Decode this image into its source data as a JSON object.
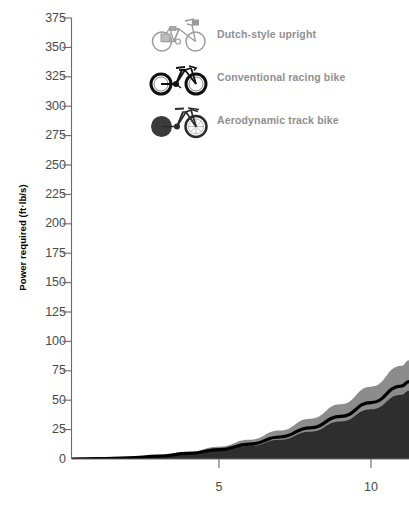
{
  "chart_data": {
    "type": "area",
    "title": "",
    "subtitle": "",
    "xlabel": "",
    "ylabel": "Power required (ft·lb/s)",
    "ylim": [
      0,
      375
    ],
    "xlim": [
      0,
      11.25
    ],
    "yticks": [
      0,
      25,
      50,
      75,
      100,
      125,
      150,
      175,
      200,
      225,
      250,
      275,
      300,
      325,
      350,
      375
    ],
    "ytick_labels": [
      "0",
      "25",
      "50",
      "75",
      "100",
      "125",
      "150",
      "175",
      "200",
      "225",
      "250",
      "275",
      "300",
      "325",
      "350",
      "375"
    ],
    "xticks": [
      5,
      10
    ],
    "xtick_labels": [
      "5",
      "10"
    ],
    "grid": false,
    "legend_position": "top-center",
    "x": [
      0,
      1,
      2,
      3,
      4,
      5,
      6,
      7,
      8,
      9,
      10,
      11,
      11.25
    ],
    "series": [
      {
        "name": "Dutch-style upright",
        "color": "#8c8c8c",
        "values": [
          0,
          0.4,
          1.4,
          3.2,
          6.2,
          10.5,
          16.4,
          24.3,
          34.3,
          46.6,
          61.5,
          79.2,
          84.0
        ]
      },
      {
        "name": "Conventional racing bike",
        "color": "#000000",
        "values": [
          0,
          0.3,
          1.0,
          2.4,
          4.7,
          8.0,
          12.6,
          18.7,
          26.5,
          36.2,
          48.0,
          62.0,
          65.8
        ]
      },
      {
        "name": "Aerodynamic track bike",
        "color": "#2e2e2e",
        "values": [
          0,
          0.25,
          0.9,
          2.1,
          4.1,
          7.0,
          11.0,
          16.4,
          23.2,
          31.8,
          42.2,
          54.6,
          58.0
        ]
      }
    ]
  },
  "axes": {
    "y_axis_title": "Power required (ft·lb/s)"
  },
  "legend": {
    "items": [
      {
        "icon": "dutch-upright-bicycle-icon",
        "label": "Dutch-style upright",
        "color": "#8c8c8c"
      },
      {
        "icon": "racing-bicycle-icon",
        "label": "Conventional racing bike",
        "color": "#000000"
      },
      {
        "icon": "aero-track-bicycle-icon",
        "label": "Aerodynamic track bike",
        "color": "#2e2e2e"
      }
    ]
  },
  "colors": {
    "dutch": "#8c8c8c",
    "racing": "#000000",
    "aero": "#2e2e2e",
    "axis": "#6b6b6b",
    "tick_text": "#4a4a4a",
    "legend_text": "#8f8f8f",
    "background": "#ffffff"
  }
}
